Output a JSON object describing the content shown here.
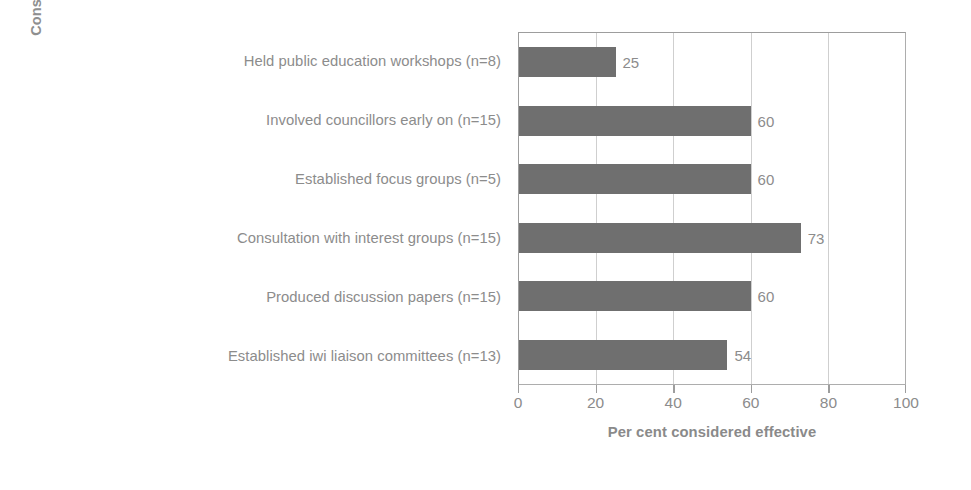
{
  "chart_data": {
    "type": "bar",
    "orientation": "horizontal",
    "title": "",
    "xlabel": "Per cent considered effective",
    "ylabel_line1": "Consultation actions and frequency",
    "ylabel_line2": "of use",
    "ylabel": "Consultation actions and frequency of use",
    "xlim": [
      0,
      100
    ],
    "xticks": [
      0,
      20,
      40,
      60,
      80,
      100
    ],
    "xticklabels": [
      "0",
      "20",
      "40",
      "60",
      "80",
      "100"
    ],
    "grid": "vertical",
    "legend": "none",
    "categories": [
      "Held public education workshops (n=8)",
      "Involved councillors early on (n=15)",
      "Established focus groups (n=5)",
      "Consultation with interest groups (n=15)",
      "Produced discussion papers (n=15)",
      "Established iwi liaison committees (n=13)"
    ],
    "values": [
      25,
      60,
      60,
      73,
      60,
      54
    ],
    "value_labels": [
      "25",
      "60",
      "60",
      "73",
      "60",
      "54"
    ],
    "bars": [
      {
        "category": "Held public education workshops (n=8)",
        "value": 25,
        "label": "25"
      },
      {
        "category": "Involved councillors early on (n=15)",
        "value": 60,
        "label": "60"
      },
      {
        "category": "Established focus groups (n=5)",
        "value": 60,
        "label": "60"
      },
      {
        "category": "Consultation with interest groups (n=15)",
        "value": 73,
        "label": "73"
      },
      {
        "category": "Produced discussion papers (n=15)",
        "value": 60,
        "label": "60"
      },
      {
        "category": "Established iwi liaison committees (n=13)",
        "value": 54,
        "label": "54"
      }
    ],
    "colors": {
      "bar_fill": "#6f6f6f",
      "text": "#8c8c8c",
      "axis_line": "#9d9d9d",
      "gridline": "#cfcfcf",
      "background": "#ffffff"
    }
  }
}
